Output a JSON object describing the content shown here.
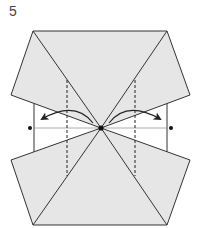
{
  "diagram": {
    "step_number": "5",
    "colors": {
      "paper_fill": "#e6e6e6",
      "line": "#333333",
      "thin_line": "#777777",
      "background": "#ffffff"
    },
    "markers": {
      "center_point": {
        "x": 101,
        "y": 128
      },
      "left_dot": {
        "x": 30,
        "y": 128
      },
      "right_dot": {
        "x": 171,
        "y": 128
      }
    },
    "fold_lines": [
      {
        "type": "valley-dashed",
        "x": 67,
        "y1": 80,
        "y2": 176
      },
      {
        "type": "valley-dashed",
        "x": 135,
        "y1": 80,
        "y2": 176
      }
    ],
    "arrows": [
      {
        "direction": "left",
        "from": "center_point",
        "to": "left_dot"
      },
      {
        "direction": "right",
        "from": "center_point",
        "to": "right_dot"
      }
    ]
  }
}
